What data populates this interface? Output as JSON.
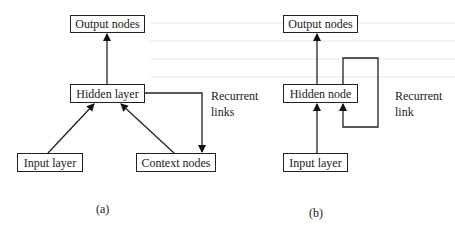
{
  "figure": {
    "panels": [
      {
        "id": "a",
        "caption": "(a)",
        "nodes": {
          "output": "Output nodes",
          "hidden": "Hidden layer",
          "input": "Input layer",
          "context": "Context nodes"
        },
        "recurrent_label_line1": "Recurrent",
        "recurrent_label_line2": "links",
        "edges": [
          {
            "from": "Input layer",
            "to": "Hidden layer"
          },
          {
            "from": "Context nodes",
            "to": "Hidden layer"
          },
          {
            "from": "Hidden layer",
            "to": "Output nodes"
          },
          {
            "from": "Hidden layer",
            "to": "Context nodes",
            "type": "recurrent"
          }
        ]
      },
      {
        "id": "b",
        "caption": "(b)",
        "nodes": {
          "output": "Output nodes",
          "hidden": "Hidden node",
          "input": "Input layer"
        },
        "recurrent_label_line1": "Recurrent",
        "recurrent_label_line2": "link",
        "edges": [
          {
            "from": "Input layer",
            "to": "Hidden node"
          },
          {
            "from": "Hidden node",
            "to": "Output nodes"
          },
          {
            "from": "Hidden node",
            "to": "Hidden node",
            "type": "recurrent"
          }
        ]
      }
    ]
  }
}
